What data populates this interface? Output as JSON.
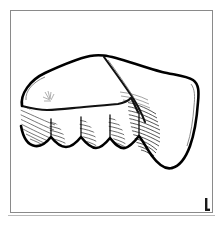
{
  "figure": {
    "kind": "line-drawing",
    "caption": "",
    "background_color": "#ffffff",
    "ink_color": "#000000",
    "frame": {
      "name": "figure-frame",
      "color": "#8a8a8a",
      "x": 10,
      "y": 10,
      "width": 202,
      "height": 202,
      "stroke_width": 1
    },
    "baseline_rule": {
      "name": "bottom-rule",
      "color": "#b9b9b9",
      "x1": 8,
      "y1": 215,
      "x2": 215,
      "y2": 215
    },
    "scale_bar": {
      "name": "scale-bar",
      "label": "",
      "color": "#1a1a1a",
      "x": 205,
      "y": 198,
      "height": 13,
      "foot_width": 5
    },
    "artifact": {
      "name": "stone-tool-outline",
      "outline_color": "#000000",
      "outline_width": 2.6,
      "fill": "#ffffff",
      "ridge_color": "#111111",
      "hatch_color": "#2b2b2b",
      "denticulate_teeth": 5,
      "hatch_zones": [
        "left-lower-flank",
        "denticulate-edge-scars",
        "right-dense-flake-scar"
      ]
    }
  }
}
